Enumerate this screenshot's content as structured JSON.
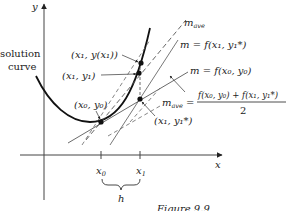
{
  "figure": {
    "caption": "Figure 9.9",
    "axes": {
      "x_label": "x",
      "y_label": "y"
    },
    "ticks": [
      {
        "label": "x",
        "sub": "0"
      },
      {
        "label": "x",
        "sub": "1"
      }
    ],
    "brace_label": "h",
    "curve_label_line1": "solution",
    "curve_label_line2": "curve",
    "points": [
      {
        "text": "(x₁, y(x₁))"
      },
      {
        "text": "(x₁, y₁)"
      },
      {
        "text": "(x₀, y₀)"
      },
      {
        "text": "(x₁, y₁*)"
      }
    ],
    "lines": [
      {
        "text": "m",
        "sub": "ave"
      },
      {
        "text": "m = f(x₁, y₁*)"
      },
      {
        "text": "m = f(x₀, y₀)"
      }
    ],
    "formula": {
      "lhs": "m",
      "lhs_sub": "ave",
      "numerator": "f(x₀, y₀) + f(x₁, y₁*)",
      "denominator": "2"
    },
    "colors": {
      "ink": "#222222",
      "background": "#ffffff"
    }
  }
}
